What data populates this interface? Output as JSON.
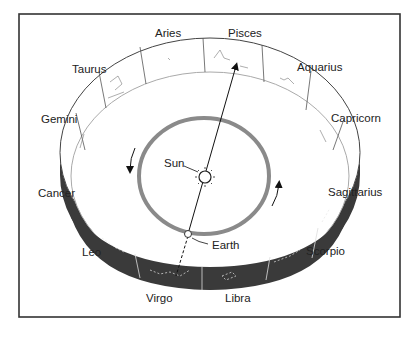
{
  "diagram": {
    "type": "zodiac-orbit-cylinder",
    "colors": {
      "frame": "#333333",
      "band_dark": "#3a3a3a",
      "band_light": "#ffffff",
      "orbit": "#8a8a8a",
      "text": "#222222"
    },
    "labels": {
      "sun": "Sun",
      "earth": "Earth"
    },
    "constellations": [
      {
        "name": "Aries"
      },
      {
        "name": "Pisces"
      },
      {
        "name": "Aquarius"
      },
      {
        "name": "Capricorn"
      },
      {
        "name": "Sagittarius"
      },
      {
        "name": "Scorpio"
      },
      {
        "name": "Libra"
      },
      {
        "name": "Virgo"
      },
      {
        "name": "Leo"
      },
      {
        "name": "Cancer"
      },
      {
        "name": "Gemini"
      },
      {
        "name": "Taurus"
      }
    ],
    "sightline": {
      "from": "Earth",
      "through": "Sun",
      "points_to": "Pisces",
      "opposite": "Virgo"
    },
    "orbit_direction": "counterclockwise"
  }
}
